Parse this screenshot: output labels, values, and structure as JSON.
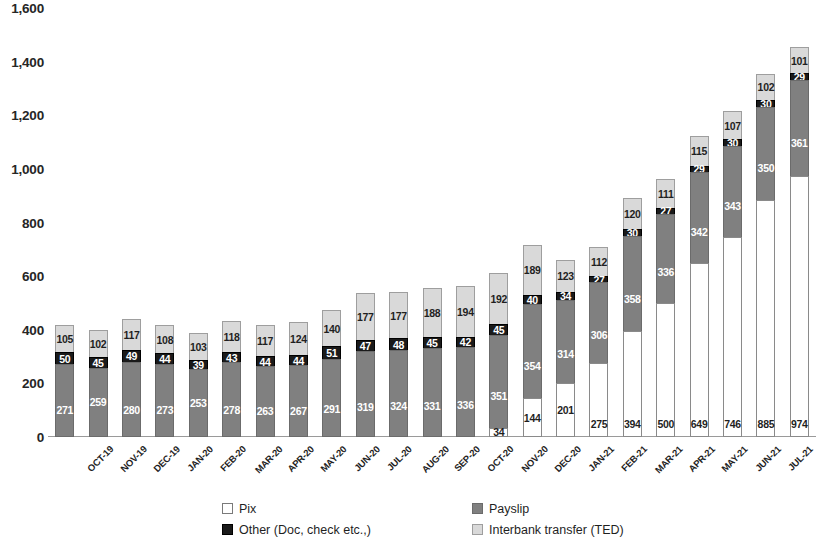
{
  "chart_data": {
    "type": "bar",
    "stacked": true,
    "title": "",
    "subtitle": "",
    "xlabel": "",
    "ylabel": "",
    "ylim": [
      0,
      1600
    ],
    "yticks": [
      "0",
      "200",
      "400",
      "600",
      "800",
      "1,000",
      "1,200",
      "1,400",
      "1,600"
    ],
    "ytick_values": [
      0,
      200,
      400,
      600,
      800,
      1000,
      1200,
      1400,
      1600
    ],
    "grid": false,
    "legend_position": "bottom",
    "categories": [
      "OCT-19",
      "NOV-19",
      "DEC-19",
      "JAN-20",
      "FEB-20",
      "MAR-20",
      "APR-20",
      "MAY-20",
      "JUN-20",
      "JUL-20",
      "AUG-20",
      "SEP-20",
      "OCT-20",
      "NOV-20",
      "DEC-20",
      "JAN-21",
      "FEB-21",
      "MAR-21",
      "APR-21",
      "MAY-21",
      "JUN-21",
      "JUL-21",
      "AUG-21"
    ],
    "stack_order": [
      "Pix",
      "Payslip",
      "Other (Doc, check etc.,)",
      "Interbank transfer (TED)"
    ],
    "series": [
      {
        "name": "Pix",
        "color": "#ffffff",
        "values": [
          0,
          0,
          0,
          0,
          0,
          0,
          0,
          0,
          0,
          0,
          0,
          0,
          0,
          34,
          144,
          201,
          275,
          394,
          500,
          649,
          746,
          885,
          974
        ]
      },
      {
        "name": "Payslip",
        "color": "#808080",
        "values": [
          271,
          259,
          280,
          273,
          253,
          278,
          263,
          267,
          291,
          319,
          324,
          331,
          336,
          351,
          354,
          314,
          306,
          358,
          336,
          342,
          343,
          350,
          361
        ]
      },
      {
        "name": "Other (Doc, check etc.,)",
        "color": "#1a1a1a",
        "values": [
          50,
          45,
          49,
          44,
          39,
          43,
          44,
          44,
          51,
          47,
          48,
          45,
          42,
          45,
          40,
          34,
          27,
          30,
          27,
          29,
          30,
          30,
          29
        ]
      },
      {
        "name": "Interbank transfer (TED)",
        "color": "#d9d9d9",
        "values": [
          105,
          102,
          117,
          108,
          103,
          118,
          117,
          124,
          140,
          177,
          177,
          188,
          194,
          192,
          189,
          123,
          112,
          120,
          111,
          115,
          107,
          102,
          101
        ]
      }
    ],
    "totals": [
      426,
      406,
      446,
      425,
      395,
      439,
      424,
      435,
      482,
      543,
      549,
      564,
      572,
      622,
      727,
      672,
      720,
      902,
      974,
      1135,
      1226,
      1367,
      1465
    ]
  },
  "legend": {
    "items": [
      {
        "label": "Pix",
        "swatch": "sw-pix"
      },
      {
        "label": "Payslip",
        "swatch": "sw-payslip"
      },
      {
        "label": "Other (Doc, check etc.,)",
        "swatch": "sw-other"
      },
      {
        "label": "Interbank transfer (TED)",
        "swatch": "sw-ted"
      }
    ],
    "order": [
      0,
      1,
      2,
      3
    ]
  }
}
